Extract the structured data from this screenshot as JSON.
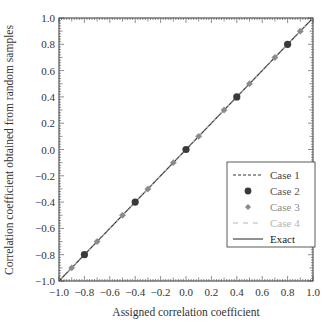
{
  "chart_data": {
    "type": "scatter",
    "title": "",
    "xlabel": "Assigned correlation coefficient",
    "ylabel": "Correlation coefficient obtained from random samples",
    "xlim": [
      -1.0,
      1.0
    ],
    "ylim": [
      -1.0,
      1.0
    ],
    "xticks": [
      "-1.0",
      "-0.8",
      "-0.6",
      "-0.4",
      "-0.2",
      "0.0",
      "0.2",
      "0.4",
      "0.6",
      "0.8",
      "1.0"
    ],
    "yticks": [
      "-1.0",
      "-0.8",
      "-0.6",
      "-0.4",
      "-0.2",
      "0.0",
      "0.2",
      "0.4",
      "0.6",
      "0.8",
      "1.0"
    ],
    "grid": false,
    "legend_position": "lower right",
    "series": [
      {
        "name": "Case 1",
        "style": "dashed line",
        "color": "#333333",
        "x": [
          -1.0,
          1.0
        ],
        "y": [
          -1.0,
          1.0
        ]
      },
      {
        "name": "Case 2",
        "style": "circle markers",
        "color": "#3a3a3a",
        "x": [
          -0.8,
          -0.4,
          0.0,
          0.4,
          0.8
        ],
        "y": [
          -0.8,
          -0.4,
          0.0,
          0.4,
          0.8
        ]
      },
      {
        "name": "Case 3",
        "style": "diamond markers",
        "color": "#8a8a8a",
        "x": [
          -0.9,
          -0.7,
          -0.5,
          -0.3,
          -0.1,
          0.1,
          0.3,
          0.5,
          0.7,
          0.9
        ],
        "y": [
          -0.9,
          -0.7,
          -0.5,
          -0.3,
          -0.1,
          0.1,
          0.3,
          0.5,
          0.7,
          0.9
        ]
      },
      {
        "name": "Case 4",
        "style": "long-dashed line",
        "color": "#b5b5b5",
        "x": [
          -1.0,
          1.0
        ],
        "y": [
          -1.0,
          1.0
        ]
      },
      {
        "name": "Exact",
        "style": "solid line",
        "color": "#222222",
        "x": [
          -1.0,
          1.0
        ],
        "y": [
          -1.0,
          1.0
        ]
      }
    ]
  },
  "legend": {
    "items": [
      {
        "label": "Case 1",
        "color": "#444444"
      },
      {
        "label": "Case 2",
        "color": "#555555"
      },
      {
        "label": "Case 3",
        "color": "#8a8a8a"
      },
      {
        "label": "Case 4",
        "color": "#b5b5b5"
      },
      {
        "label": "Exact",
        "color": "#222222"
      }
    ]
  }
}
